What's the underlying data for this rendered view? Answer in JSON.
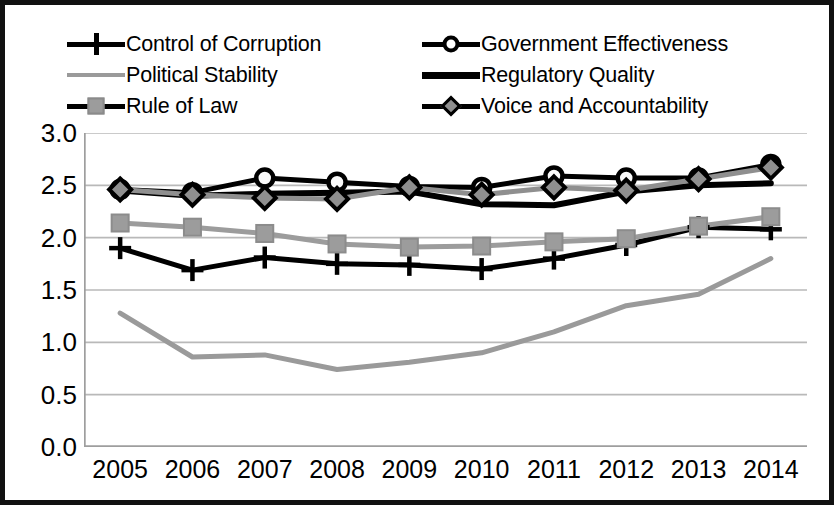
{
  "chart_data": {
    "type": "line",
    "title": "",
    "xlabel": "",
    "ylabel": "",
    "categories": [
      "2005",
      "2006",
      "2007",
      "2008",
      "2009",
      "2010",
      "2011",
      "2012",
      "2013",
      "2014"
    ],
    "ylim": [
      0.0,
      3.0
    ],
    "ytick_labels": [
      "3.0",
      "2.5",
      "2.0",
      "1.5",
      "1.0",
      "0.5",
      "0.0"
    ],
    "ytick_values": [
      3.0,
      2.5,
      2.0,
      1.5,
      1.0,
      0.5,
      0.0
    ],
    "grid": true,
    "legend_position": "top",
    "series": [
      {
        "name": "Control of Corruption",
        "marker": "plus",
        "color": "#000000",
        "values": [
          1.9,
          1.69,
          1.81,
          1.75,
          1.74,
          1.7,
          1.8,
          1.93,
          2.1,
          2.08
        ]
      },
      {
        "name": "Government Effectiveness",
        "marker": "circle",
        "color": "#000000",
        "values": [
          2.46,
          2.43,
          2.57,
          2.53,
          2.49,
          2.48,
          2.59,
          2.57,
          2.57,
          2.7
        ]
      },
      {
        "name": "Political Stability",
        "marker": "none",
        "color": "#9a9a9a",
        "values": [
          1.28,
          0.86,
          0.88,
          0.74,
          0.81,
          0.9,
          1.1,
          1.35,
          1.46,
          1.8
        ]
      },
      {
        "name": "Regulatory Quality",
        "marker": "none",
        "color": "#000000",
        "values": [
          2.45,
          2.4,
          2.42,
          2.43,
          2.44,
          2.32,
          2.31,
          2.44,
          2.5,
          2.52
        ]
      },
      {
        "name": "Rule of Law",
        "marker": "square",
        "color": "#9c9c9c",
        "values": [
          2.14,
          2.1,
          2.04,
          1.94,
          1.91,
          1.92,
          1.96,
          1.99,
          2.11,
          2.2
        ]
      },
      {
        "name": "Voice and Accountability",
        "marker": "diamond",
        "color": "#8f8f8f",
        "values": [
          2.46,
          2.41,
          2.38,
          2.37,
          2.48,
          2.41,
          2.48,
          2.45,
          2.56,
          2.67
        ]
      }
    ]
  },
  "legend": {
    "items": [
      {
        "label": "Control of Corruption",
        "marker": "plus-marker",
        "style": "line"
      },
      {
        "label": "Government Effectiveness",
        "marker": "circle-marker",
        "style": "line"
      },
      {
        "label": "Political Stability",
        "marker": "none",
        "style": "gray-line"
      },
      {
        "label": "Regulatory Quality",
        "marker": "none",
        "style": "thick-line"
      },
      {
        "label": "Rule of Law",
        "marker": "square-marker",
        "style": "line"
      },
      {
        "label": "Voice and Accountability",
        "marker": "diamond-marker",
        "style": "line"
      }
    ]
  }
}
